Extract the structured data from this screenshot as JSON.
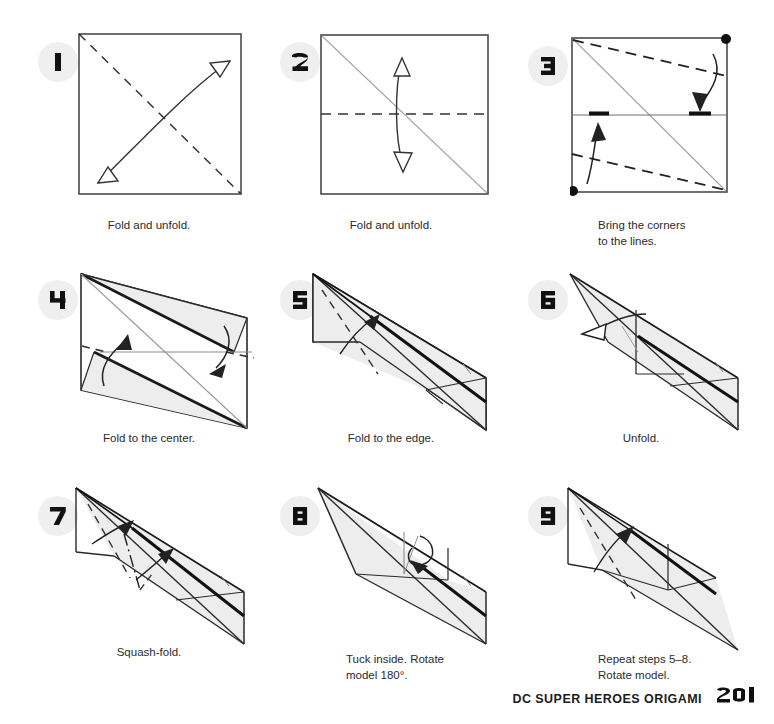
{
  "footer": {
    "book_title": "DC SUPER HEROES ORIGAMI",
    "page_number": "201"
  },
  "colors": {
    "badge_background": "#efefef",
    "badge_number": "#111111",
    "paper_fill": "#ffffff",
    "paper_shade": "#ededed",
    "outline": "#4a4a4a",
    "strong_outline": "#1a1a1a",
    "crease_line": "#9a9a9a",
    "text": "#2b2b2b"
  },
  "steps": [
    {
      "number": "1",
      "caption": "Fold and unfold.",
      "caption_align": "center",
      "shape": "square",
      "marks": [
        "valley-fold-diagonal",
        "double-headed-hollow-arrow"
      ]
    },
    {
      "number": "2",
      "caption": "Fold and unfold.",
      "caption_align": "center",
      "shape": "square",
      "marks": [
        "existing-crease-diagonal",
        "valley-fold-horizontal",
        "double-headed-hollow-arrow"
      ]
    },
    {
      "number": "3",
      "caption": "Bring the corners\nto the lines.",
      "caption_align": "left",
      "shape": "square",
      "marks": [
        "corner-dots",
        "reference-tick-marks",
        "two-valley-folds",
        "two-solid-arrows"
      ]
    },
    {
      "number": "4",
      "caption": "Fold to the center.",
      "caption_align": "center",
      "shape": "parallelogram",
      "marks": [
        "two-shaded-flaps",
        "center-line",
        "two-solid-arrows"
      ]
    },
    {
      "number": "5",
      "caption": "Fold to the edge.",
      "caption_align": "center",
      "shape": "folded-sliver",
      "marks": [
        "valley-fold-dashed",
        "curved-solid-arrow"
      ]
    },
    {
      "number": "6",
      "caption": "Unfold.",
      "caption_align": "center",
      "shape": "folded-sliver",
      "marks": [
        "hollow-unfold-arrow"
      ]
    },
    {
      "number": "7",
      "caption": "Squash-fold.",
      "caption_align": "center",
      "shape": "folded-sliver",
      "marks": [
        "dash-dot-mountain-fold",
        "valley-fold-dashed",
        "two-solid-arrows"
      ]
    },
    {
      "number": "8",
      "caption": "Tuck inside. Rotate\nmodel 180°.",
      "caption_align": "left",
      "shape": "narrow-dart",
      "marks": [
        "tuck-loop-arrow"
      ]
    },
    {
      "number": "9",
      "caption": "Repeat steps 5–8.\nRotate model.",
      "caption_align": "left",
      "shape": "long-dart",
      "marks": [
        "valley-fold-dashed",
        "curved-solid-arrow"
      ]
    }
  ]
}
